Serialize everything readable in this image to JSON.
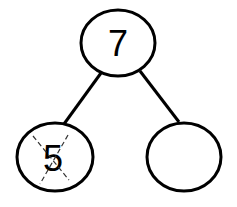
{
  "diagram": {
    "type": "number-bond",
    "whole": "7",
    "parts": [
      {
        "value": "5",
        "crossed_out": true
      },
      {
        "value": "",
        "crossed_out": false
      }
    ],
    "colors": {
      "stroke": "#000000",
      "background": "#ffffff",
      "dash": "#333333"
    }
  }
}
